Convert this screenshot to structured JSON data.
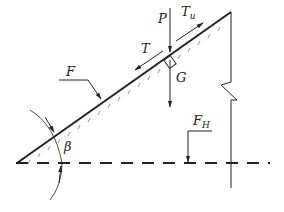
{
  "labels": {
    "P": "P",
    "Tu_main": "T",
    "Tu_sub": "u",
    "T": "T",
    "G": "G",
    "F": "F",
    "FH_main": "F",
    "FH_sub": "H",
    "beta": "β"
  },
  "colors": {
    "stroke": "#222222",
    "background": "#ffffff"
  }
}
